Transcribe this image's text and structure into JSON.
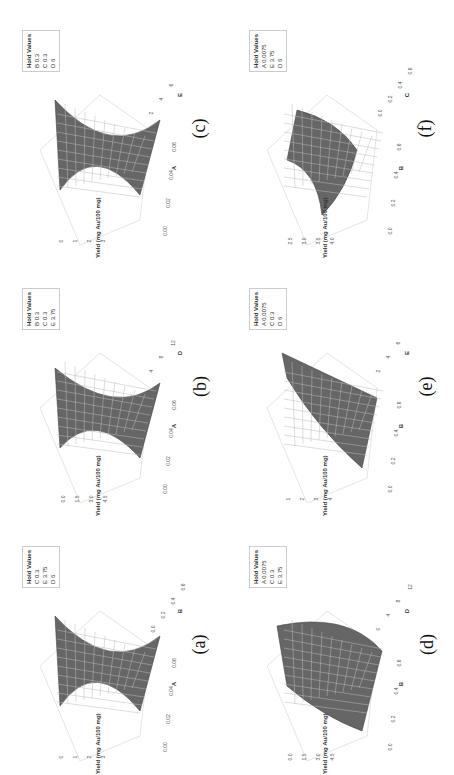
{
  "figure": {
    "response_label": "Yield (mg Au/100 mg)"
  },
  "chart_data": [
    {
      "panel": "(c)",
      "type": "surface",
      "x_factor": "A",
      "y_factor": "E",
      "zlabel": "Yield (mg Au/100 mg)",
      "x_ticks": [
        "0.00",
        "0.02",
        "0.04",
        "0.06"
      ],
      "y_ticks": [
        "2",
        "4",
        "6"
      ],
      "z_ticks": [
        "0",
        "1",
        "2",
        "3"
      ],
      "hold_values": [
        {
          "factor": "B",
          "value": "0.3"
        },
        {
          "factor": "C",
          "value": "0.3"
        },
        {
          "factor": "D",
          "value": "6"
        }
      ],
      "shape": "saddle/U-shaped along A"
    },
    {
      "panel": "(f)",
      "type": "surface",
      "x_factor": "B",
      "y_factor": "C",
      "zlabel": "Yield (mg Au/100 mg)",
      "x_ticks": [
        "0.0",
        "0.2",
        "0.4",
        "0.6"
      ],
      "y_ticks": [
        "0.0",
        "0.2",
        "0.4",
        "0.6"
      ],
      "z_ticks": [
        "2.5",
        "3.0",
        "3.5",
        "4.0"
      ],
      "hold_values": [
        {
          "factor": "A",
          "value": "0.0075"
        },
        {
          "factor": "E",
          "value": "3.75"
        },
        {
          "factor": "D",
          "value": "6"
        }
      ],
      "shape": "twisted surface"
    },
    {
      "panel": "(b)",
      "type": "surface",
      "x_factor": "A",
      "y_factor": "D",
      "zlabel": "Yield (mg Au/100 mg)",
      "x_ticks": [
        "0.00",
        "0.02",
        "0.04",
        "0.06"
      ],
      "y_ticks": [
        "4",
        "8",
        "12"
      ],
      "z_ticks": [
        "0.0",
        "1.5",
        "3.0",
        "4.5"
      ],
      "hold_values": [
        {
          "factor": "B",
          "value": "0.3"
        },
        {
          "factor": "C",
          "value": "0.3"
        },
        {
          "factor": "E",
          "value": "3.75"
        }
      ],
      "shape": "U-shaped along A"
    },
    {
      "panel": "(e)",
      "type": "surface",
      "x_factor": "B",
      "y_factor": "E",
      "zlabel": "Yield (mg Au/100 mg)",
      "x_ticks": [
        "0.0",
        "0.2",
        "0.4",
        "0.6"
      ],
      "y_ticks": [
        "2",
        "4",
        "6"
      ],
      "z_ticks": [
        "1",
        "2",
        "3",
        "4"
      ],
      "hold_values": [
        {
          "factor": "A",
          "value": "0.0075"
        },
        {
          "factor": "C",
          "value": "0.3"
        },
        {
          "factor": "D",
          "value": "6"
        }
      ],
      "shape": "rising plane-like surface"
    },
    {
      "panel": "(a)",
      "type": "surface",
      "x_factor": "A",
      "y_factor": "B",
      "zlabel": "Yield (mg Au/100 mg)",
      "x_ticks": [
        "0.00",
        "0.02",
        "0.04",
        "0.06"
      ],
      "y_ticks": [
        "0.0",
        "0.2",
        "0.4",
        "0.6"
      ],
      "z_ticks": [
        "0",
        "1",
        "2",
        "3"
      ],
      "hold_values": [
        {
          "factor": "C",
          "value": "0.3"
        },
        {
          "factor": "E",
          "value": "3.75"
        },
        {
          "factor": "D",
          "value": "6"
        }
      ],
      "shape": "U-shaped along A"
    },
    {
      "panel": "(d)",
      "type": "surface",
      "x_factor": "B",
      "y_factor": "D",
      "zlabel": "Yield (mg Au/100 mg)",
      "x_ticks": [
        "0.0",
        "0.2",
        "0.4",
        "0.6"
      ],
      "y_ticks": [
        "0",
        "4",
        "8",
        "12"
      ],
      "z_ticks": [
        "0.0",
        "1.5",
        "3.0",
        "4.5"
      ],
      "hold_values": [
        {
          "factor": "A",
          "value": "0.0075"
        },
        {
          "factor": "C",
          "value": "0.3"
        },
        {
          "factor": "E",
          "value": "3.75"
        }
      ],
      "shape": "curved rising surface"
    }
  ],
  "hold_title": "Hold Values"
}
